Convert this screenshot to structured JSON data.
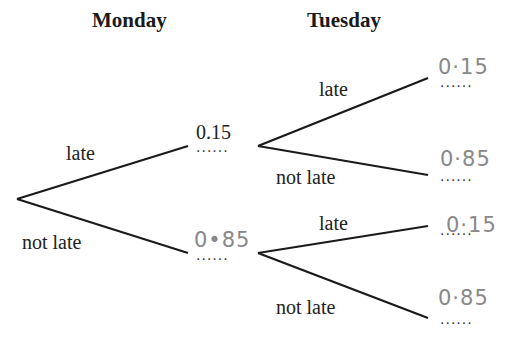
{
  "headers": {
    "monday": "Monday",
    "tuesday": "Tuesday"
  },
  "monday": {
    "late": {
      "label": "late",
      "prob": "0.15",
      "prob_style": "printed"
    },
    "not_late": {
      "label": "not late",
      "prob": "0•85",
      "prob_style": "handwritten"
    }
  },
  "tuesday": {
    "after_late": {
      "late": {
        "label": "late",
        "prob": "0·15"
      },
      "not_late": {
        "label": "not late",
        "prob": "0·85"
      }
    },
    "after_not_late": {
      "late": {
        "label": "late",
        "prob": "0·15"
      },
      "not_late": {
        "label": "not late",
        "prob": "0·85"
      }
    }
  },
  "answer_dots": "......",
  "colors": {
    "line": "#1a1a1a",
    "handwriting": "#888888"
  }
}
